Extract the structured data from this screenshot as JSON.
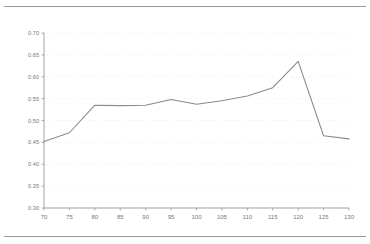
{
  "header": {
    "clipped_text_left": "",
    "clipped_text_right": "",
    "note": "top header text is clipped by the screenshot edge and illegible"
  },
  "chart_data": {
    "type": "line",
    "title": "",
    "subtitle": "",
    "xlabel": "",
    "ylabel": "",
    "x": [
      70,
      75,
      80,
      85,
      90,
      95,
      100,
      105,
      110,
      115,
      120,
      125,
      130
    ],
    "values": [
      0.452,
      0.472,
      0.535,
      0.534,
      0.535,
      0.548,
      0.537,
      0.545,
      0.556,
      0.575,
      0.635,
      0.465,
      0.458
    ],
    "series": [
      {
        "name": "",
        "values": [
          0.452,
          0.472,
          0.535,
          0.534,
          0.535,
          0.548,
          0.537,
          0.545,
          0.556,
          0.575,
          0.635,
          0.465,
          0.458
        ]
      }
    ],
    "xlim": [
      70,
      130
    ],
    "ylim": [
      0.3,
      0.7
    ],
    "xticks": [
      70,
      75,
      80,
      85,
      90,
      95,
      100,
      105,
      110,
      115,
      120,
      125,
      130
    ],
    "xtick_labels": [
      "70",
      "75",
      "80",
      "85",
      "90",
      "95",
      "100",
      "105",
      "110",
      "115",
      "120",
      "125",
      "130"
    ],
    "yticks": [
      0.3,
      0.35,
      0.4,
      0.45,
      0.5,
      0.55,
      0.6,
      0.65,
      0.7
    ],
    "ytick_labels": [
      "0.30",
      "0.35",
      "0.40",
      "0.45",
      "0.50",
      "0.55",
      "0.60",
      "0.65",
      "0.70"
    ],
    "grid": true,
    "grid_style": "dotted-horizontal",
    "legend": false,
    "legend_position": "none",
    "line_color": "#8a8a8a",
    "grid_color": "#e9e9e9",
    "axis_color": "#9a9a9a",
    "tick_label_color": "#777777",
    "background": "#ffffff"
  }
}
